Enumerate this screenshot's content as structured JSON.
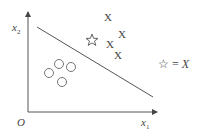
{
  "axes": {
    "origin_label": "O",
    "x_label": "x",
    "x_sub": "1",
    "y_label": "x",
    "y_sub": "2"
  },
  "class_x": {
    "marker": "X",
    "points": [
      [
        108,
        18
      ],
      [
        122,
        35
      ],
      [
        110,
        45
      ],
      [
        118,
        56
      ]
    ]
  },
  "class_o": {
    "marker": "circle",
    "points": [
      [
        59,
        64
      ],
      [
        71,
        67
      ],
      [
        49,
        73
      ],
      [
        62,
        82
      ]
    ]
  },
  "query_point": {
    "marker": "star",
    "position": [
      92,
      40
    ]
  },
  "decision_boundary": {
    "from": [
      37,
      27
    ],
    "to": [
      153,
      97
    ]
  },
  "legend": {
    "star_symbol": "☆",
    "equals_text": "= ",
    "class_label": "X"
  },
  "colors": {
    "ink": "#444444",
    "background": "#ffffff"
  }
}
